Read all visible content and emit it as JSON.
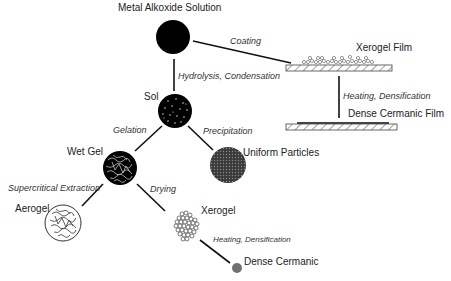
{
  "diagram": {
    "nodes": {
      "metal_alkoxide": {
        "label": "Metal Alkoxide Solution"
      },
      "sol": {
        "label": "Sol"
      },
      "wet_gel": {
        "label": "Wet Gel"
      },
      "uniform_particles": {
        "label": "Uniform Particles"
      },
      "aerogel": {
        "label": "Aerogel"
      },
      "xerogel": {
        "label": "Xerogel"
      },
      "dense_ceramic": {
        "label": "Dense Cermanic"
      },
      "xerogel_film": {
        "label": "Xerogel Film"
      },
      "dense_ceramic_film": {
        "label": "Dense Cermanic Film"
      }
    },
    "edges": {
      "coating": {
        "label": "Coating"
      },
      "hydrolysis": {
        "label": "Hydrolysis, Condensation"
      },
      "gelation": {
        "label": "Gelation"
      },
      "precipitation": {
        "label": "Precipitation"
      },
      "supercritical": {
        "label": "Supercritical Extraction"
      },
      "drying": {
        "label": "Drying"
      },
      "film_heating": {
        "label": "Heating, Densification"
      },
      "xerogel_heating": {
        "label": "Heating, Densification"
      }
    },
    "colors": {
      "ink": "#000000",
      "particles": "#555555",
      "dense_dot": "#707070",
      "background": "#ffffff"
    }
  }
}
